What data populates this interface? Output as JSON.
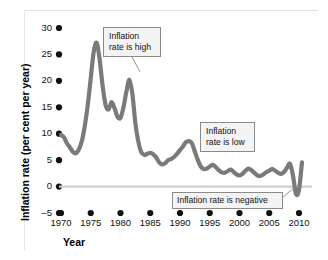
{
  "chart_data": {
    "type": "line",
    "title": "",
    "xlabel": "Year",
    "ylabel": "Inflation rate (per cent per year)",
    "xlim": [
      1970,
      2011
    ],
    "ylim": [
      -5,
      31
    ],
    "grid": false,
    "legend": "none",
    "x_ticks": [
      1970,
      1975,
      1980,
      1985,
      1990,
      1995,
      2000,
      2005,
      2010
    ],
    "y_ticks": [
      -5,
      0,
      5,
      10,
      15,
      20,
      25,
      30
    ],
    "zero_line": 0,
    "series": [
      {
        "name": "Inflation rate",
        "color": "#7a7a7a",
        "x": [
          1970,
          1970.5,
          1971,
          1971.5,
          1972,
          1972.5,
          1973,
          1973.5,
          1974,
          1974.5,
          1975,
          1975.5,
          1976,
          1976.5,
          1977,
          1977.5,
          1978,
          1978.5,
          1979,
          1979.5,
          1980,
          1980.5,
          1981,
          1981.5,
          1982,
          1982.5,
          1983,
          1983.5,
          1984,
          1984.5,
          1985,
          1985.5,
          1986,
          1986.5,
          1987,
          1987.5,
          1988,
          1988.5,
          1989,
          1989.5,
          1990,
          1990.5,
          1991,
          1991.5,
          1992,
          1992.5,
          1993,
          1993.5,
          1994,
          1994.5,
          1995,
          1995.5,
          1996,
          1996.5,
          1997,
          1997.5,
          1998,
          1998.5,
          1999,
          1999.5,
          2000,
          2000.5,
          2001,
          2001.5,
          2002,
          2002.5,
          2003,
          2003.5,
          2004,
          2004.5,
          2005,
          2005.5,
          2006,
          2006.5,
          2007,
          2007.5,
          2008,
          2008.5,
          2009,
          2009.5,
          2010,
          2010.5
        ],
        "y": [
          9.8,
          9.3,
          8.2,
          7.4,
          6.6,
          6.3,
          7.0,
          8.6,
          11.5,
          15.5,
          20.5,
          25.5,
          27.2,
          24.0,
          19.0,
          15.4,
          14.6,
          16.0,
          14.8,
          13.2,
          13.0,
          15.0,
          18.0,
          20.2,
          17.5,
          12.0,
          8.5,
          6.5,
          6.0,
          6.2,
          6.4,
          6.1,
          5.5,
          4.6,
          4.2,
          4.4,
          5.0,
          5.2,
          5.6,
          6.2,
          6.9,
          7.6,
          8.4,
          8.6,
          8.2,
          6.6,
          5.0,
          3.8,
          3.3,
          3.4,
          3.8,
          4.1,
          3.7,
          3.1,
          2.7,
          2.6,
          2.9,
          3.2,
          2.8,
          2.3,
          2.1,
          2.4,
          3.0,
          3.4,
          3.1,
          2.6,
          2.1,
          2.0,
          2.3,
          2.7,
          3.0,
          3.3,
          3.0,
          2.6,
          2.4,
          2.8,
          3.6,
          4.3,
          2.0,
          -1.4,
          -0.6,
          4.6
        ],
        "annotated_peaks": [
          {
            "year": 1976,
            "value": 27.2,
            "note": "highest inflation"
          },
          {
            "year": 1981.5,
            "value": 20.2,
            "note": "second peak"
          },
          {
            "year": 2009.5,
            "value": -1.4,
            "note": "negative inflation"
          }
        ]
      }
    ],
    "annotations": [
      {
        "id": "high",
        "text": "Inflation\nrate is high"
      },
      {
        "id": "low",
        "text": "Inflation\nrate is low"
      },
      {
        "id": "negative",
        "text": "Inflation rate is negative"
      }
    ]
  }
}
